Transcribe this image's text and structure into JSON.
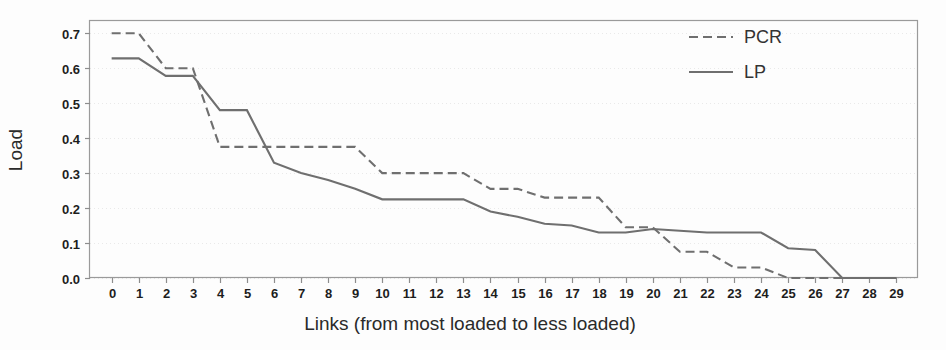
{
  "chart_data": {
    "type": "line",
    "title": "",
    "subtitle": "",
    "xlabel": "Links (from most loaded to less loaded)",
    "ylabel": "Load",
    "xlim": [
      -0.8,
      29.8
    ],
    "ylim": [
      0.0,
      0.735
    ],
    "grid": true,
    "grid_axis": "y",
    "legend_position": "top-right",
    "x": [
      0,
      1,
      2,
      3,
      4,
      5,
      6,
      7,
      8,
      9,
      10,
      11,
      12,
      13,
      14,
      15,
      16,
      17,
      18,
      19,
      20,
      21,
      22,
      23,
      24,
      25,
      26,
      27,
      28,
      29
    ],
    "x_tick_labels": [
      "0",
      "1",
      "2",
      "3",
      "4",
      "5",
      "6",
      "7",
      "8",
      "9",
      "10",
      "11",
      "12",
      "13",
      "14",
      "15",
      "16",
      "17",
      "18",
      "19",
      "20",
      "21",
      "22",
      "23",
      "24",
      "25",
      "26",
      "27",
      "28",
      "29"
    ],
    "y_tick_labels": [
      "0.0",
      "0.1",
      "0.2",
      "0.3",
      "0.4",
      "0.5",
      "0.6",
      "0.7"
    ],
    "y_ticks": [
      0.0,
      0.1,
      0.2,
      0.3,
      0.4,
      0.5,
      0.6,
      0.7
    ],
    "series": [
      {
        "name": "PCR",
        "style": "dashed",
        "color": "#6f6f6f",
        "values": [
          0.7,
          0.7,
          0.6,
          0.6,
          0.375,
          0.375,
          0.375,
          0.375,
          0.375,
          0.375,
          0.3,
          0.3,
          0.3,
          0.3,
          0.255,
          0.255,
          0.23,
          0.23,
          0.23,
          0.145,
          0.145,
          0.075,
          0.075,
          0.03,
          0.03,
          0.0,
          0.0,
          0.0,
          0.0,
          0.0
        ]
      },
      {
        "name": "LP",
        "style": "solid",
        "color": "#6f6f6f",
        "values": [
          0.628,
          0.628,
          0.578,
          0.578,
          0.48,
          0.48,
          0.33,
          0.3,
          0.28,
          0.255,
          0.225,
          0.225,
          0.225,
          0.225,
          0.19,
          0.175,
          0.155,
          0.15,
          0.13,
          0.13,
          0.14,
          0.135,
          0.13,
          0.13,
          0.13,
          0.085,
          0.08,
          0.0,
          0.0,
          0.0
        ]
      }
    ]
  },
  "legend": {
    "entries": [
      {
        "label": "PCR",
        "style": "dashed"
      },
      {
        "label": "LP",
        "style": "solid"
      }
    ]
  }
}
